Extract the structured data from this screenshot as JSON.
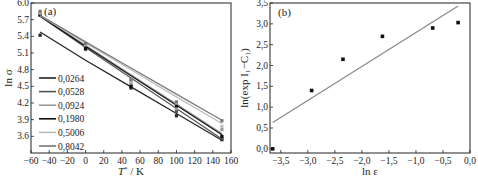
{
  "chart_data": [
    {
      "type": "line",
      "panel_label": "(a)",
      "xlabel": "T*/K",
      "ylabel": "ln σ",
      "xlim": [
        -60,
        160
      ],
      "ylim": [
        3.3,
        6.0
      ],
      "xticks": [
        "-60",
        "-40",
        "-20",
        "0",
        "20",
        "40",
        "60",
        "80",
        "100",
        "120",
        "140",
        "160"
      ],
      "yticks": [
        "3.6",
        "3.9",
        "4.2",
        "4.5",
        "4.8",
        "5.1",
        "5.4",
        "5.7",
        "6.0"
      ],
      "grid": false,
      "legend_position": "lower left",
      "x": [
        -50,
        0,
        50,
        100,
        150
      ],
      "series": [
        {
          "name": "0,0264",
          "color": "#222222",
          "values": [
            5.42,
            5.17,
            4.47,
            3.97,
            3.54
          ],
          "fit": [
            5.48,
            4.97,
            4.49,
            4.01,
            3.53
          ]
        },
        {
          "name": "0,0528",
          "color": "#555555",
          "values": [
            5.8,
            5.2,
            4.5,
            4.05,
            3.57
          ],
          "fit": [
            5.76,
            5.2,
            4.65,
            4.1,
            3.55
          ]
        },
        {
          "name": "0,0924",
          "color": "#999999",
          "values": [
            5.8,
            5.22,
            4.55,
            4.1,
            3.72
          ],
          "fit": [
            5.77,
            5.24,
            4.71,
            4.18,
            3.65
          ]
        },
        {
          "name": "0,1980",
          "color": "#111111",
          "values": [
            5.78,
            5.18,
            4.5,
            4.15,
            3.6
          ],
          "fit": [
            5.76,
            5.22,
            4.69,
            4.16,
            3.63
          ]
        },
        {
          "name": "0,5006",
          "color": "#bbbbbb",
          "values": [
            5.82,
            5.25,
            4.6,
            4.2,
            3.78
          ],
          "fit": [
            5.77,
            5.28,
            4.8,
            4.31,
            3.83
          ]
        },
        {
          "name": "0,8042",
          "color": "#777777",
          "values": [
            5.85,
            5.27,
            4.62,
            4.22,
            3.88
          ],
          "fit": [
            5.78,
            5.3,
            4.83,
            4.36,
            3.89
          ]
        }
      ]
    },
    {
      "type": "scatter",
      "panel_label": "(b)",
      "xlabel": "ln ε",
      "ylabel": "ln(exp I₁−C₁)",
      "xlim": [
        -3.7,
        0.0
      ],
      "ylim": [
        -0.1,
        3.5
      ],
      "xticks": [
        "-3,5",
        "-3,0",
        "-2,5",
        "-2,0",
        "-1,5",
        "-1,0",
        "-0,5",
        "0,0"
      ],
      "yticks": [
        "0,0",
        "0,5",
        "1,0",
        "1,5",
        "2,0",
        "2,5",
        "3,0",
        "3,5"
      ],
      "grid": false,
      "x": [
        -3.65,
        -2.93,
        -2.35,
        -1.62,
        -0.69,
        -0.22
      ],
      "values": [
        0.0,
        1.4,
        2.15,
        2.7,
        2.9,
        3.03
      ],
      "fit_line": {
        "x": [
          -3.65,
          -0.22
        ],
        "y": [
          0.63,
          3.43
        ],
        "color": "#888888"
      }
    }
  ],
  "panels": {
    "a": {
      "label": "(a)",
      "xlabel_main": "T",
      "xlabel_sup": "*",
      "xlabel_rest": " / K",
      "ylabel": "ln σ"
    },
    "b": {
      "label": "(b)",
      "xlabel": "ln ε",
      "ylabel": "ln(exp I₁−C₁)"
    }
  }
}
